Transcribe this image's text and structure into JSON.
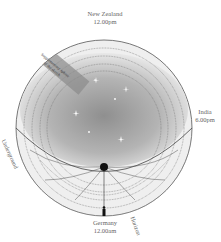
{
  "labels": {
    "top": {
      "place": "New Zealand",
      "time": "12.00pm"
    },
    "right": {
      "place": "India",
      "time": "6.00pm"
    },
    "bottom": {
      "place": "Germany",
      "time": "12.00am"
    },
    "left_region": "Underground",
    "horizon": "Horizon",
    "band_line1": "Supplementary sphere",
    "band_line2": "of the sketch"
  },
  "colors": {
    "outer_ring": "#eeeeee",
    "sky_center": "#9a9a9a",
    "sky_edge": "#e6e6e6",
    "underground": "#a8a8a8",
    "band": "#8a8a8a",
    "outline": "#444444",
    "observer": "#111111"
  },
  "stars": [
    {
      "x": 96,
      "y": 80
    },
    {
      "x": 126,
      "y": 89
    },
    {
      "x": 115,
      "y": 99
    },
    {
      "x": 76,
      "y": 113
    },
    {
      "x": 89,
      "y": 132
    },
    {
      "x": 121,
      "y": 139
    },
    {
      "x": 127,
      "y": 90
    }
  ]
}
